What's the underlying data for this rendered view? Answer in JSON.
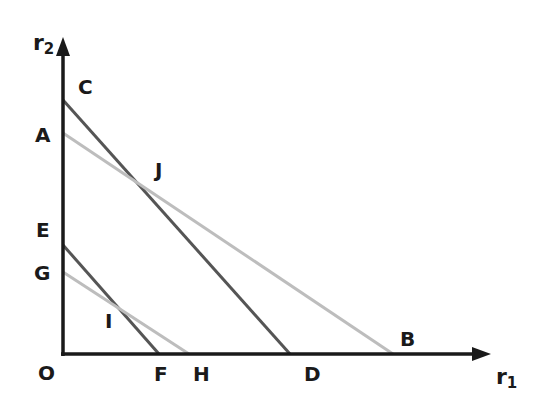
{
  "diagram": {
    "axes": {
      "x_label": "r",
      "x_sub": "1",
      "y_label": "r",
      "y_sub": "2",
      "origin_label": "O"
    },
    "points": {
      "C": "C",
      "A": "A",
      "J": "J",
      "E": "E",
      "G": "G",
      "I": "I",
      "F": "F",
      "H": "H",
      "D": "D",
      "B": "B"
    },
    "lines": [
      {
        "name": "CD",
        "from": "C",
        "to": "D",
        "color": "#555555"
      },
      {
        "name": "AB",
        "from": "A",
        "to": "B",
        "color": "#bdbdbd"
      },
      {
        "name": "EF",
        "from": "E",
        "to": "F",
        "color": "#555555"
      },
      {
        "name": "GH",
        "from": "G",
        "to": "H",
        "color": "#bdbdbd"
      }
    ],
    "intersections": [
      {
        "label": "J",
        "lines": [
          "CD",
          "AB"
        ]
      },
      {
        "label": "I",
        "lines": [
          "EF",
          "GH"
        ]
      }
    ],
    "colors": {
      "axis": "#1a1a1a",
      "dark_line": "#555555",
      "light_line": "#bdbdbd"
    }
  }
}
